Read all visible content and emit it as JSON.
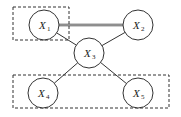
{
  "diagram": {
    "type": "graphical-model",
    "nodes": [
      {
        "id": "X1",
        "label": "X",
        "sub": "1",
        "cx": 44,
        "cy": 25,
        "r": 15
      },
      {
        "id": "X2",
        "label": "X",
        "sub": "2",
        "cx": 138,
        "cy": 25,
        "r": 15
      },
      {
        "id": "X3",
        "label": "X",
        "sub": "3",
        "cx": 89,
        "cy": 53,
        "r": 15
      },
      {
        "id": "X4",
        "label": "X",
        "sub": "4",
        "cx": 43,
        "cy": 93,
        "r": 15
      },
      {
        "id": "X5",
        "label": "X",
        "sub": "5",
        "cx": 138,
        "cy": 93,
        "r": 15
      }
    ],
    "edges": [
      {
        "from": "X1",
        "to": "X2",
        "style": "double"
      },
      {
        "from": "X1",
        "to": "X3",
        "style": "single"
      },
      {
        "from": "X2",
        "to": "X3",
        "style": "single"
      },
      {
        "from": "X3",
        "to": "X4",
        "style": "single"
      },
      {
        "from": "X3",
        "to": "X5",
        "style": "single"
      }
    ],
    "groups": [
      {
        "id": "group-top",
        "members": [
          "X1"
        ],
        "x": 13,
        "y": 7,
        "w": 56,
        "h": 33
      },
      {
        "id": "group-bottom",
        "members": [
          "X4",
          "X5"
        ],
        "x": 13,
        "y": 75,
        "w": 156,
        "h": 33
      }
    ],
    "colors": {
      "stroke": "#333333",
      "background": "#ffffff"
    }
  }
}
